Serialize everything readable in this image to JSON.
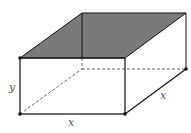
{
  "diagram": {
    "labels": {
      "height": "y",
      "width": "x",
      "depth": "x"
    },
    "colors": {
      "shaded_top": "#7a7a7a",
      "edges": "#111111",
      "hidden_edges": "#666666",
      "label": "#555555"
    }
  }
}
